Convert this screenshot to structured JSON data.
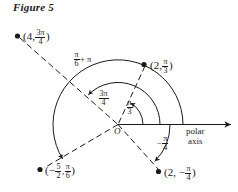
{
  "figure": {
    "title": "Figure 5",
    "origin_label": "O",
    "axis_label_line1": "polar",
    "axis_label_line2": "axis"
  },
  "points": [
    {
      "name": "point-4-3pi-4",
      "open": "(4,",
      "num": "3π",
      "den": "4",
      "close": ")",
      "r": 4,
      "theta": "3π/4"
    },
    {
      "name": "point-2-pi-3",
      "open": "(2,",
      "num": "π",
      "den": "3",
      "close": ")",
      "r": 2,
      "theta": "π/3"
    },
    {
      "name": "point-neg5-2-pi-6",
      "open": "(−",
      "num": "5",
      "den": "2",
      "mid": ",",
      "num2": "π",
      "den2": "6",
      "close": ")",
      "r": -2.5,
      "theta": "π/6"
    },
    {
      "name": "point-2-neg-pi-4",
      "open": "(2, −",
      "num": "π",
      "den": "4",
      "close": ")",
      "r": 2,
      "theta": "−π/4"
    }
  ],
  "angle_labels": [
    {
      "name": "angle-pi-6-plus-pi",
      "num": "π",
      "den": "6",
      "suffix": "+ π",
      "value": "π/6 + π"
    },
    {
      "name": "angle-3pi-4",
      "num": "3π",
      "den": "4",
      "value": "3π/4"
    },
    {
      "name": "angle-pi-3",
      "num": "π",
      "den": "3",
      "value": "π/3"
    },
    {
      "name": "angle-neg-pi-4",
      "prefix": "−",
      "num": "π",
      "den": "4",
      "value": "−π/4"
    }
  ],
  "colors": {
    "ink": "#1a1a1a",
    "background": "#ffffff"
  }
}
